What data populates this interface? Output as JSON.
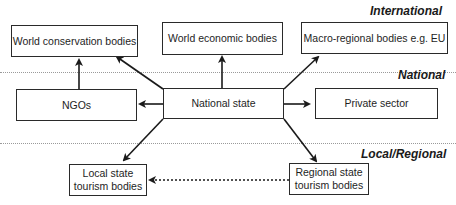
{
  "levels": {
    "international": "International",
    "national": "National",
    "local": "Local/Regional"
  },
  "boxes": {
    "world_conservation": "World conservation bodies",
    "world_economic": "World economic bodies",
    "macro_regional": "Macro-regional bodies e.g. EU",
    "ngos": "NGOs",
    "national_state": "National state",
    "private_sector": "Private sector",
    "local_state_line1": "Local state",
    "local_state_line2": "tourism bodies",
    "regional_state_line1": "Regional state",
    "regional_state_line2": "tourism bodies"
  },
  "colors": {
    "line": "#1a1a1a",
    "divider": "#9a9a9a"
  }
}
